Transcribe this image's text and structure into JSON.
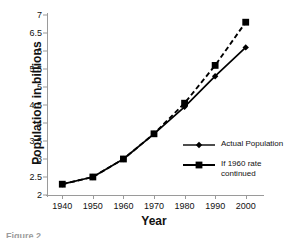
{
  "chart_data": {
    "type": "line",
    "title": "",
    "xlabel": "Year",
    "ylabel": "Population in billions",
    "x": [
      1940,
      1950,
      1960,
      1970,
      1980,
      1990,
      2000
    ],
    "categories": [
      "1940",
      "1950",
      "1960",
      "1970",
      "1980",
      "1990",
      "2000"
    ],
    "series": [
      {
        "name": "Actual Population",
        "marker": "diamond",
        "linestyle": "solid",
        "color": "#000000",
        "values": [
          2.3,
          2.5,
          3.0,
          3.7,
          4.45,
          5.3,
          6.1
        ]
      },
      {
        "name": "If 1960 rate continued",
        "marker": "square",
        "linestyle": "dashed",
        "color": "#000000",
        "values": [
          2.3,
          2.5,
          3.0,
          3.7,
          4.55,
          5.6,
          6.8
        ]
      }
    ],
    "xlim": [
      1935,
      2005
    ],
    "ylim": [
      2,
      7
    ],
    "ytick_values": [
      2,
      2.5,
      3,
      3.5,
      4,
      4.5,
      5,
      5.5,
      6,
      6.5,
      7
    ],
    "ytick_labels": [
      "2",
      "2.5",
      "3",
      "3.5",
      "4",
      "4.5",
      "5",
      "5.5",
      "6",
      "6.5",
      "7"
    ],
    "xtick_labels": [
      "1940",
      "1950",
      "1960",
      "1970",
      "1980",
      "1990",
      "2000"
    ],
    "grid": false,
    "legend_position": "inside-lower-right"
  },
  "axes": {
    "y_title": "Population in billions",
    "x_title": "Year"
  },
  "legend": {
    "entries": [
      {
        "label": "Actual Population",
        "marker": "diamond-marker",
        "style": "solid"
      },
      {
        "label": "If 1960 rate\ncontinued",
        "marker": "square-marker",
        "style": "solid-thick"
      }
    ]
  },
  "caption": "Figure 2"
}
